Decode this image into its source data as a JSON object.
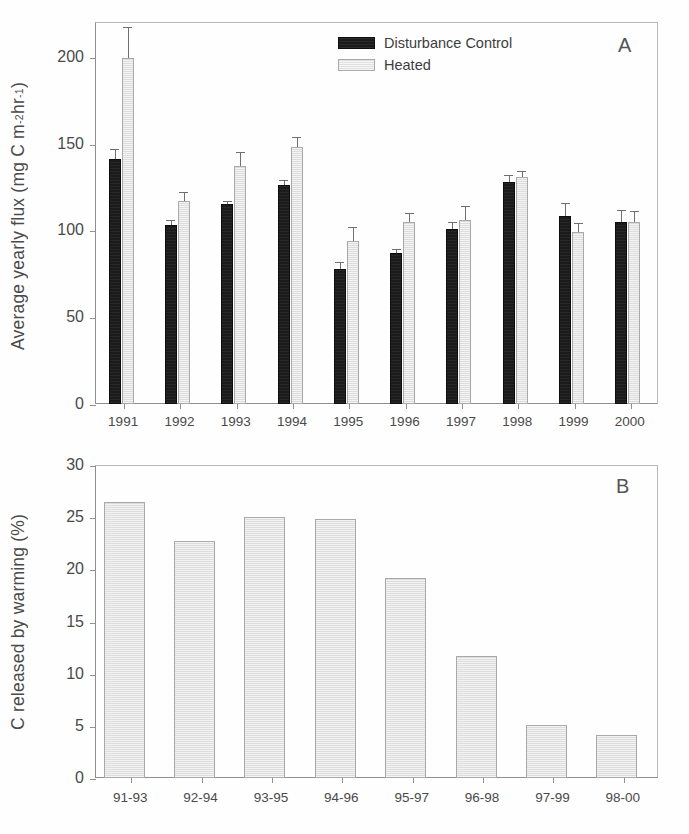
{
  "figure": {
    "background": "#ffffff",
    "panel_a_letter": "A",
    "panel_b_letter": "B"
  },
  "legend": {
    "position": "top-center-right",
    "entries": [
      {
        "label": "Disturbance Control",
        "color": "#1b1b1b",
        "swatch": "dark-filled-rect"
      },
      {
        "label": "Heated",
        "color": "#e8e8e8",
        "swatch": "light-filled-rect"
      }
    ]
  },
  "chart_data": [
    {
      "panel": "A",
      "type": "bar",
      "title": "",
      "xlabel": "",
      "ylabel": "Average yearly flux (mg C m-2 hr-1)",
      "ylabel_parts": {
        "prefix": "Average yearly flux (mg C m",
        "sup1": "-2",
        "mid": " hr",
        "sup2": "-1",
        "suffix": ")"
      },
      "ylim": [
        0,
        220
      ],
      "yticks": [
        0,
        50,
        100,
        150,
        200
      ],
      "grid": false,
      "legend": [
        "Disturbance Control",
        "Heated"
      ],
      "categories": [
        "1991",
        "1992",
        "1993",
        "1994",
        "1995",
        "1996",
        "1997",
        "1998",
        "1999",
        "2000"
      ],
      "series": [
        {
          "name": "Disturbance Control",
          "color": "#1b1b1b",
          "values": [
            141,
            103,
            115,
            126,
            78,
            87,
            101,
            128,
            108,
            105
          ],
          "errors": [
            6,
            3,
            2,
            3,
            4,
            2,
            4,
            4,
            8,
            7
          ]
        },
        {
          "name": "Heated",
          "color": "#e4e4e4",
          "values": [
            199,
            117,
            137,
            148,
            94,
            105,
            106,
            131,
            99,
            105
          ],
          "errors": [
            18,
            5,
            8,
            6,
            8,
            5,
            8,
            3,
            5,
            6
          ]
        }
      ]
    },
    {
      "panel": "B",
      "type": "bar",
      "title": "",
      "xlabel": "",
      "ylabel": "C released by warming (%)",
      "ylim": [
        0,
        30
      ],
      "yticks": [
        0,
        5,
        10,
        15,
        20,
        25,
        30
      ],
      "grid": false,
      "categories": [
        "91-93",
        "92-94",
        "93-95",
        "94-96",
        "95-97",
        "96-98",
        "97-99",
        "98-00"
      ],
      "series": [
        {
          "name": "C released by warming",
          "color": "#e4e4e4",
          "values": [
            26.5,
            22.7,
            25.0,
            24.8,
            19.2,
            11.7,
            5.1,
            4.1
          ]
        }
      ]
    }
  ]
}
